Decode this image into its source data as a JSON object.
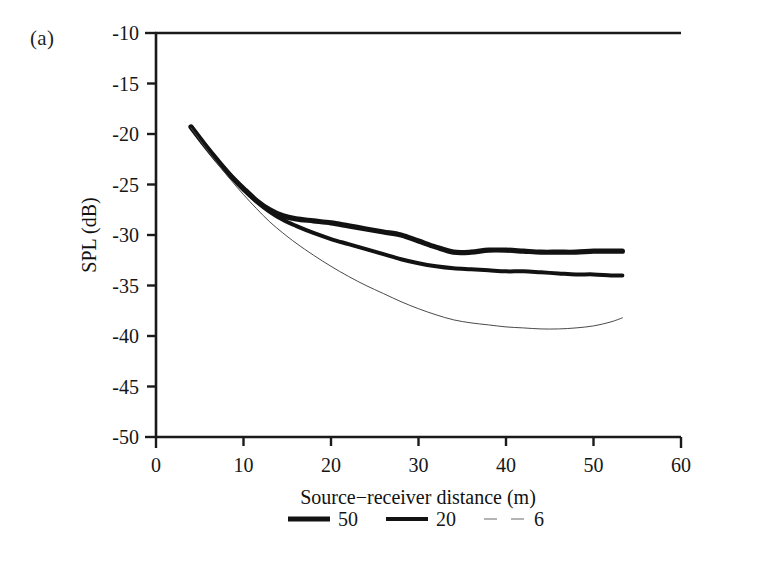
{
  "figure": {
    "panel_label": "(a)",
    "background_color": "#ffffff",
    "ink_color": "#1a1a1a"
  },
  "chart_data": {
    "type": "line",
    "title": "",
    "panel": "(a)",
    "xlabel": "Source−receiver distance (m)",
    "ylabel": "SPL (dB)",
    "xlim": [
      0,
      60
    ],
    "ylim": [
      -50,
      -10
    ],
    "xticks": [
      0,
      10,
      20,
      30,
      40,
      50,
      60
    ],
    "xtick_labels": [
      "0",
      "10",
      "20",
      "30",
      "40",
      "50",
      "60"
    ],
    "yticks": [
      -50,
      -45,
      -40,
      -35,
      -30,
      -25,
      -20,
      -15,
      -10
    ],
    "ytick_labels": [
      "-50",
      "-45",
      "-40",
      "-35",
      "-30",
      "-25",
      "-20",
      "-15",
      "-10"
    ],
    "grid": false,
    "legend_position": "below-axis-center",
    "legend_orientation": "horizontal",
    "frame": "left-bottom-top",
    "tick_direction": "out",
    "series": [
      {
        "name": "50",
        "label": "50",
        "style": "solid",
        "line_width": 5.2,
        "color": "#121212",
        "x": [
          4.0,
          5.5,
          7.0,
          8.5,
          10.0,
          11.5,
          13.0,
          14.5,
          16.0,
          18.0,
          20.0,
          22.0,
          24.0,
          26.0,
          28.0,
          30.0,
          32.0,
          34.0,
          36.0,
          38.0,
          40.0,
          42.0,
          44.0,
          46.0,
          48.0,
          50.0,
          52.0,
          53.3
        ],
        "y": [
          -19.3,
          -21.0,
          -22.6,
          -24.1,
          -25.4,
          -26.6,
          -27.5,
          -28.1,
          -28.4,
          -28.6,
          -28.8,
          -29.1,
          -29.4,
          -29.7,
          -30.0,
          -30.6,
          -31.2,
          -31.7,
          -31.7,
          -31.5,
          -31.5,
          -31.6,
          -31.7,
          -31.7,
          -31.7,
          -31.6,
          -31.6,
          -31.6
        ]
      },
      {
        "name": "20",
        "label": "20",
        "style": "solid",
        "line_width": 4.0,
        "color": "#121212",
        "x": [
          4.0,
          5.5,
          7.0,
          8.5,
          10.0,
          11.5,
          13.0,
          14.5,
          16.0,
          18.0,
          20.0,
          22.0,
          24.0,
          26.0,
          28.0,
          30.0,
          32.0,
          34.0,
          36.0,
          38.0,
          40.0,
          42.0,
          44.0,
          46.0,
          48.0,
          50.0,
          52.0,
          53.3
        ],
        "y": [
          -19.3,
          -21.0,
          -22.6,
          -24.1,
          -25.5,
          -26.7,
          -27.7,
          -28.5,
          -29.1,
          -29.8,
          -30.4,
          -30.9,
          -31.4,
          -31.9,
          -32.4,
          -32.8,
          -33.1,
          -33.3,
          -33.4,
          -33.5,
          -33.6,
          -33.6,
          -33.7,
          -33.8,
          -33.9,
          -33.9,
          -34.0,
          -34.0
        ]
      },
      {
        "name": "6",
        "label": "6",
        "style": "thin-dashed",
        "line_width": 1.0,
        "color": "#4a4a4a",
        "x": [
          4.0,
          5.5,
          7.0,
          8.5,
          10.0,
          11.5,
          13.0,
          14.5,
          16.0,
          18.0,
          20.0,
          22.0,
          24.0,
          26.0,
          28.0,
          30.0,
          32.0,
          34.0,
          36.0,
          38.0,
          40.0,
          42.0,
          44.0,
          46.0,
          48.0,
          50.0,
          52.0,
          53.3
        ],
        "y": [
          -19.4,
          -21.2,
          -22.9,
          -24.5,
          -26.0,
          -27.4,
          -28.7,
          -29.8,
          -30.8,
          -32.0,
          -33.1,
          -34.1,
          -35.0,
          -35.8,
          -36.6,
          -37.3,
          -37.9,
          -38.4,
          -38.7,
          -38.9,
          -39.1,
          -39.2,
          -39.3,
          -39.3,
          -39.2,
          -39.0,
          -38.6,
          -38.2
        ]
      }
    ]
  },
  "legend": {
    "entries": [
      {
        "label": "50",
        "style": "solid-thick"
      },
      {
        "label": "20",
        "style": "solid-medium"
      },
      {
        "label": "6",
        "style": "thin-dashed"
      }
    ]
  }
}
